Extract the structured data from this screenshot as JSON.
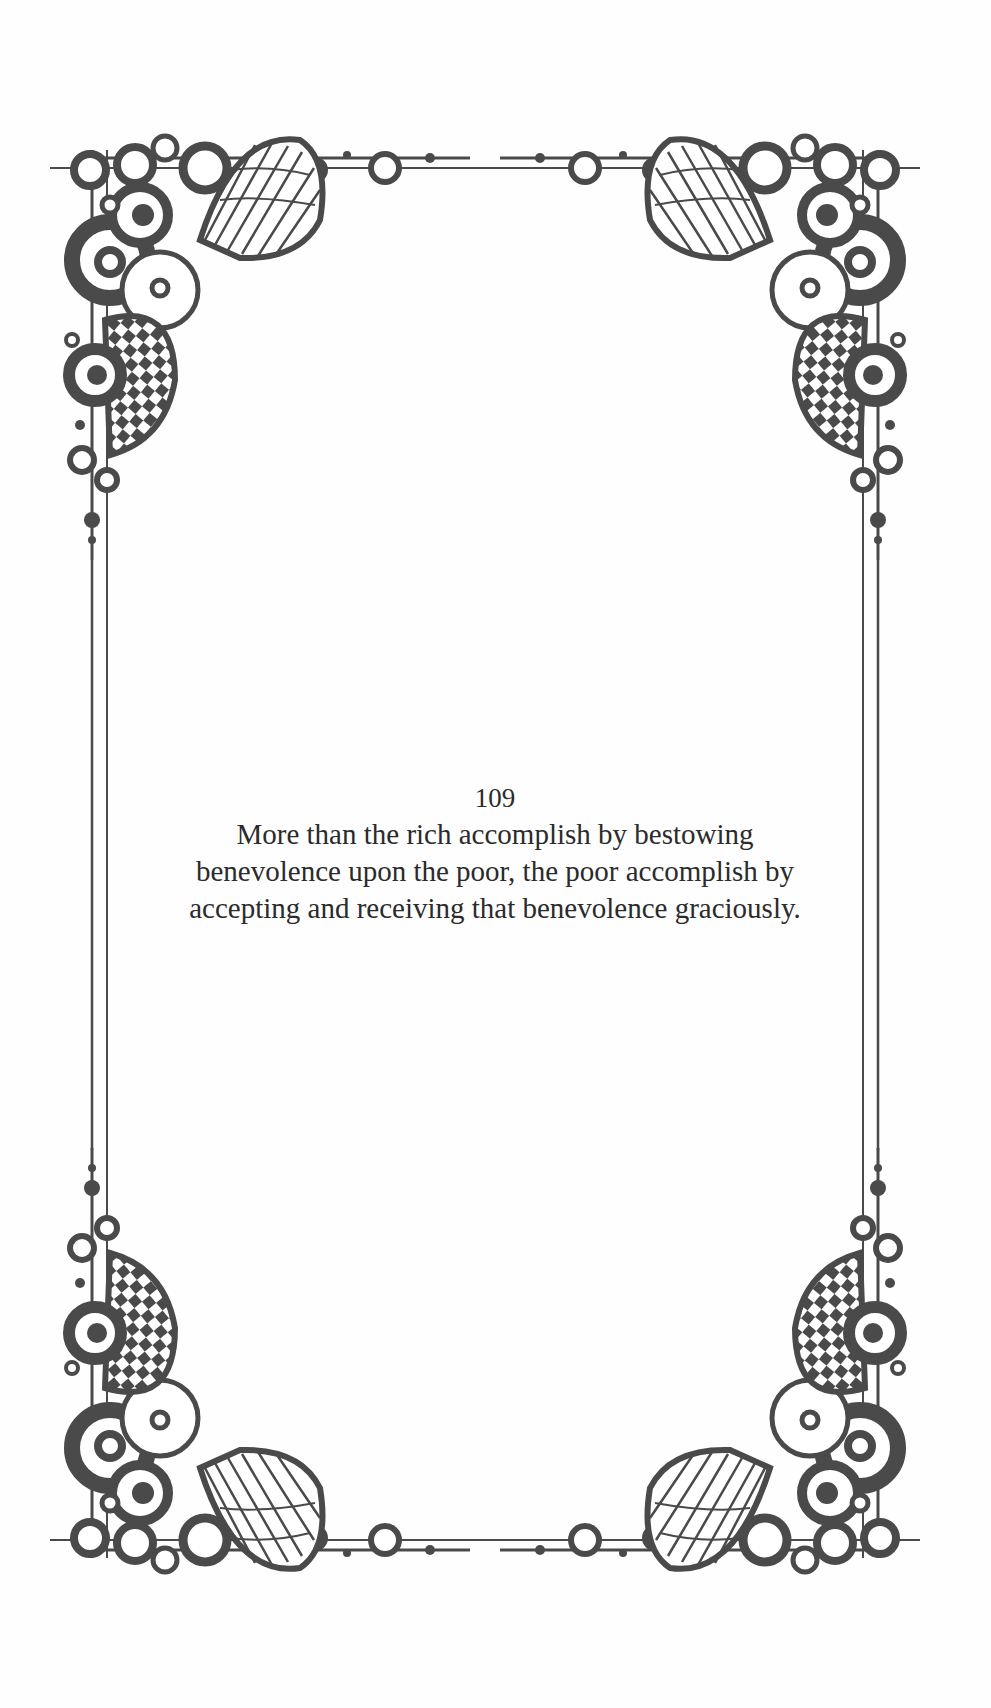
{
  "page": {
    "number": "109",
    "lines": [
      "More than the rich accomplish by bestowing",
      "benevolence upon the poor, the poor accomplish by",
      "accepting and receiving that benevolence graciously."
    ]
  },
  "ornament": {
    "style": "decorative-border-frame",
    "ink_color": "#4a4a4a",
    "corners": [
      "top-left",
      "top-right",
      "bottom-left",
      "bottom-right"
    ]
  }
}
